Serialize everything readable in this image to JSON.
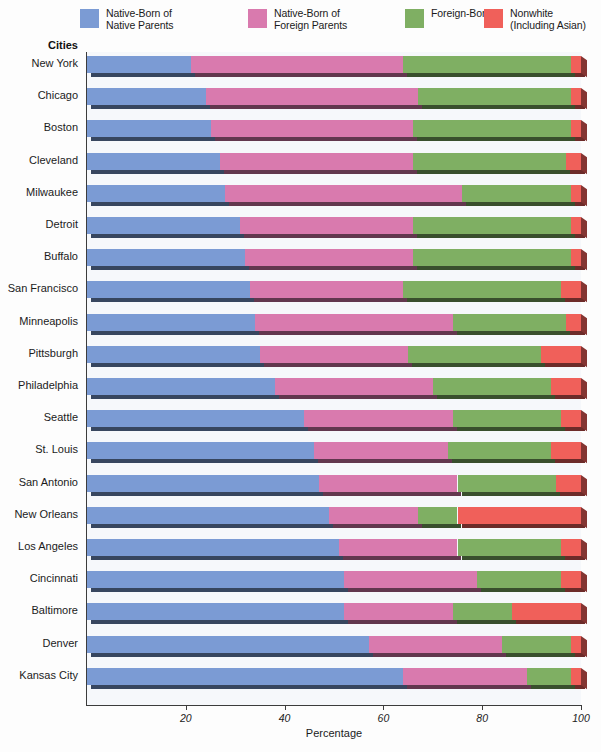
{
  "chart_data": {
    "type": "bar",
    "orientation": "horizontal",
    "stacked": true,
    "title": "",
    "xlabel": "Percentage",
    "ylabel": "Cities",
    "xlim": [
      0,
      100
    ],
    "xticks": [
      20,
      40,
      60,
      80,
      100
    ],
    "grid": false,
    "legend_position": "top",
    "series": [
      {
        "name": "Native-Born of\nNative Parents",
        "color": "#7b9bd4",
        "values": [
          21,
          24,
          25,
          27,
          28,
          31,
          32,
          33,
          34,
          35,
          38,
          44,
          46,
          47,
          49,
          51,
          52,
          52,
          57,
          64
        ]
      },
      {
        "name": "Native-Born of\nForeign Parents",
        "color": "#d97aae",
        "values": [
          43,
          43,
          41,
          39,
          48,
          35,
          34,
          31,
          40,
          30,
          32,
          30,
          27,
          28,
          18,
          24,
          27,
          22,
          27,
          25
        ]
      },
      {
        "name": "Foreign-Born",
        "color": "#7faf63",
        "values": [
          34,
          31,
          32,
          31,
          22,
          32,
          32,
          32,
          23,
          27,
          24,
          22,
          21,
          20,
          8,
          21,
          17,
          12,
          14,
          9
        ]
      },
      {
        "name": "Nonwhite\n(Including Asian)",
        "color": "#f0605a",
        "values": [
          2,
          2,
          2,
          3,
          2,
          2,
          2,
          4,
          3,
          8,
          6,
          4,
          6,
          5,
          25,
          4,
          4,
          14,
          2,
          2
        ]
      }
    ],
    "categories": [
      "New York",
      "Chicago",
      "Boston",
      "Cleveland",
      "Milwaukee",
      "Detroit",
      "Buffalo",
      "San Francisco",
      "Minneapolis",
      "Pittsburgh",
      "Philadelphia",
      "Seattle",
      "St. Louis",
      "San Antonio",
      "New Orleans",
      "Los Angeles",
      "Cincinnati",
      "Baltimore",
      "Denver",
      "Kansas City"
    ]
  },
  "legend": {
    "items": [
      {
        "label": "Native-Born of\nNative Parents",
        "color": "#7b9bd4",
        "icon": "color-swatch-icon"
      },
      {
        "label": "Native-Born of\nForeign Parents",
        "color": "#d97aae",
        "icon": "color-swatch-icon"
      },
      {
        "label": "Foreign-Born",
        "color": "#7faf63",
        "icon": "color-swatch-icon"
      },
      {
        "label": "Nonwhite\n(Including Asian)",
        "color": "#f0605a",
        "icon": "color-swatch-icon"
      }
    ]
  },
  "axes": {
    "y_title": "Cities",
    "x_title": "Percentage",
    "x_tick_labels": [
      "20",
      "40",
      "60",
      "80",
      "100"
    ]
  }
}
